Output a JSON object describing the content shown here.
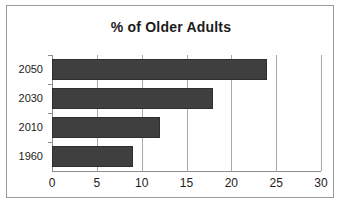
{
  "chart_data": {
    "type": "bar",
    "orientation": "horizontal",
    "title": "% of Older Adults",
    "xlabel": "",
    "ylabel": "",
    "categories": [
      "1960",
      "2010",
      "2030",
      "2050"
    ],
    "values": [
      9,
      12,
      18,
      24
    ],
    "xlim": [
      0,
      30
    ],
    "xticks": [
      0,
      5,
      10,
      15,
      20,
      25,
      30
    ],
    "xtick_labels": [
      "0",
      "5",
      "10",
      "15",
      "20",
      "25",
      "30"
    ],
    "grid": "vertical",
    "legend": "none",
    "bar_color": "#3f3f3f",
    "plot_background": "#ffffff",
    "frame_color": "#9a9a9a",
    "text_color": "#1c1c1c",
    "bars_top_to_bottom": [
      {
        "category": "2050",
        "value": 24
      },
      {
        "category": "2030",
        "value": 18
      },
      {
        "category": "2010",
        "value": 12
      },
      {
        "category": "1960",
        "value": 9
      }
    ]
  }
}
